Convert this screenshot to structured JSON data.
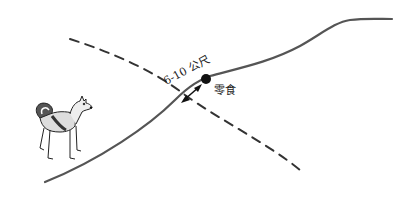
{
  "diagram": {
    "distance_label": "6-10 公尺",
    "treat_label": "零食",
    "colors": {
      "trail": "#555555",
      "dashed": "#333333",
      "dot": "#111111",
      "arrow": "#111111"
    },
    "elements": {
      "dog": "standing-dog-illustration",
      "trail": "solid-curved-path",
      "crossing_line": "dashed-line",
      "treat_marker": "black-dot",
      "distance_arrow": "double-headed-arrow"
    }
  }
}
